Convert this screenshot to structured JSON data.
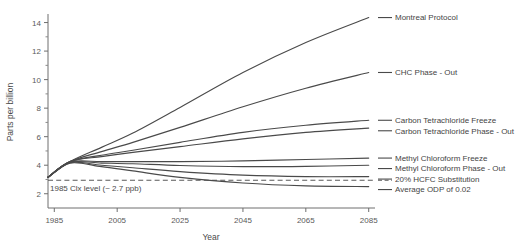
{
  "chart_data": {
    "type": "line",
    "title": "",
    "xlabel": "Year",
    "ylabel": "Parts per billion",
    "xlim": [
      1983,
      2087
    ],
    "ylim": [
      1.0,
      14.6
    ],
    "grid": false,
    "legend_position": "right-inline-labels",
    "x_ticks": [
      1985,
      2005,
      2025,
      2045,
      2065,
      2085
    ],
    "x_tick_labels": [
      "1985",
      "2005",
      "2025",
      "2045",
      "2065",
      "2085"
    ],
    "y_ticks": [
      2,
      4,
      6,
      8,
      10,
      12,
      14
    ],
    "y_tick_labels": [
      "2",
      "4",
      "6",
      "8",
      "10",
      "12",
      "14"
    ],
    "y_minor_ticks": [
      3,
      5,
      7,
      9,
      11,
      13
    ],
    "x": [
      1983,
      1990,
      2000,
      2010,
      2025,
      2045,
      2065,
      2085
    ],
    "reference_line": {
      "label": "1985 Clx level (~ 2.7 ppb)",
      "value": 2.95,
      "style": "dashed"
    },
    "series": [
      {
        "name": "Montreal Protocol",
        "label": "Montreal Protocol",
        "values": [
          3.15,
          4.25,
          5.25,
          6.25,
          8.05,
          10.5,
          12.6,
          14.35
        ]
      },
      {
        "name": "CHC Phase - Out",
        "label": "CHC Phase - Out",
        "values": [
          3.15,
          4.25,
          4.95,
          5.6,
          6.65,
          8.1,
          9.4,
          10.5
        ]
      },
      {
        "name": "Carbon Tetrachloride Freeze",
        "label": "Carbon Tetrachloride Freeze",
        "values": [
          3.15,
          4.25,
          4.7,
          5.05,
          5.6,
          6.3,
          6.8,
          7.15
        ]
      },
      {
        "name": "Carbon Tetrachloride Phase - Out",
        "label": "Carbon Tetrachloride Phase - Out",
        "values": [
          3.15,
          4.25,
          4.6,
          4.9,
          5.3,
          5.85,
          6.3,
          6.6
        ]
      },
      {
        "name": "Methyl Chloroform Freeze",
        "label": "Methyl Chloroform Freeze",
        "values": [
          3.15,
          4.22,
          4.25,
          4.25,
          4.25,
          4.3,
          4.4,
          4.5
        ]
      },
      {
        "name": "Methyl Chloroform Phase - Out",
        "label": "Methyl Chloroform Phase - Out",
        "values": [
          3.15,
          4.2,
          4.15,
          4.1,
          3.98,
          3.9,
          3.92,
          4.0
        ]
      },
      {
        "name": "20% HCFC Substitution",
        "label": "20% HCFC Substitution",
        "values": [
          3.15,
          4.18,
          4.0,
          3.82,
          3.55,
          3.3,
          3.2,
          3.2
        ]
      },
      {
        "name": "Average ODP of 0.02",
        "label": "Average ODP of 0.02",
        "values": [
          3.15,
          4.15,
          3.9,
          3.6,
          3.15,
          2.75,
          2.55,
          2.5
        ]
      }
    ]
  },
  "colors": {
    "line": "#4a4a4a",
    "axis": "#6e6e6e",
    "text": "#444444",
    "background": "#ffffff"
  }
}
